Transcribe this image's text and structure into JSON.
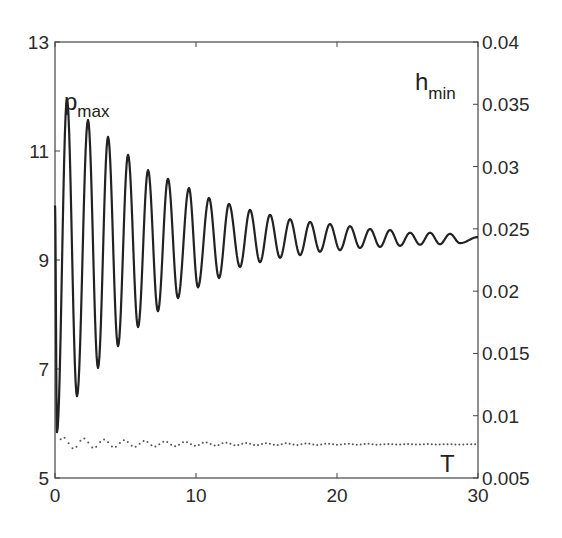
{
  "chart_data": {
    "type": "line",
    "title": "",
    "xlabel": "",
    "ylabel": "",
    "xlim": [
      0,
      30
    ],
    "ylim_left": [
      5,
      13
    ],
    "ylim_right": [
      0.005,
      0.04
    ],
    "grid": false,
    "x_ticks": [
      0,
      10,
      20,
      30
    ],
    "y_ticks_left": [
      5,
      7,
      9,
      11,
      13
    ],
    "y_ticks_right": [
      0.005,
      0.01,
      0.015,
      0.02,
      0.025,
      0.03,
      0.035,
      0.04
    ],
    "y_tick_labels_right": [
      "0.005",
      "0.01",
      "0.015",
      "0.02",
      "0.025",
      "0.03",
      "0.035",
      "0.04"
    ],
    "annotations": [
      {
        "text": "p",
        "sub": "max",
        "position": "top-left"
      },
      {
        "text": "h",
        "sub": "min",
        "position": "top-right"
      },
      {
        "text": "T",
        "position": "bottom-right"
      }
    ],
    "series": [
      {
        "name": "p_max",
        "axis": "left",
        "style": "solid",
        "color": "#222222",
        "extrema": [
          [
            0,
            10.0
          ],
          [
            0.14,
            5.84
          ],
          [
            0.85,
            11.95
          ],
          [
            1.56,
            6.5
          ],
          [
            2.34,
            11.57
          ],
          [
            3.05,
            7.02
          ],
          [
            3.76,
            11.26
          ],
          [
            4.47,
            7.42
          ],
          [
            5.18,
            10.93
          ],
          [
            5.89,
            7.77
          ],
          [
            6.6,
            10.65
          ],
          [
            7.3,
            8.06
          ],
          [
            8.01,
            10.49
          ],
          [
            8.72,
            8.3
          ],
          [
            9.5,
            10.32
          ],
          [
            10.14,
            8.5
          ],
          [
            10.92,
            10.14
          ],
          [
            11.63,
            8.67
          ],
          [
            12.34,
            10.03
          ],
          [
            13.12,
            8.87
          ],
          [
            13.83,
            9.92
          ],
          [
            14.54,
            8.96
          ],
          [
            15.25,
            9.83
          ],
          [
            15.96,
            9.04
          ],
          [
            16.67,
            9.75
          ],
          [
            17.38,
            9.09
          ],
          [
            18.09,
            9.7
          ],
          [
            18.79,
            9.15
          ],
          [
            19.5,
            9.66
          ],
          [
            20.21,
            9.18
          ],
          [
            20.92,
            9.62
          ],
          [
            21.63,
            9.22
          ],
          [
            22.34,
            9.57
          ],
          [
            23.05,
            9.24
          ],
          [
            23.76,
            9.55
          ],
          [
            24.47,
            9.26
          ],
          [
            25.18,
            9.5
          ],
          [
            25.89,
            9.28
          ],
          [
            26.6,
            9.5
          ],
          [
            27.3,
            9.29
          ],
          [
            28.01,
            9.48
          ],
          [
            28.72,
            9.31
          ],
          [
            30,
            9.42
          ]
        ]
      },
      {
        "name": "h_min (T)",
        "axis": "right",
        "style": "dotted",
        "color": "#444444",
        "mean": 0.0078,
        "final": 0.0077,
        "initial_amplitude": 0.0005,
        "period": 1.44,
        "decay": 0.12,
        "x_start": 0.4,
        "x_step": 0.28
      }
    ]
  }
}
